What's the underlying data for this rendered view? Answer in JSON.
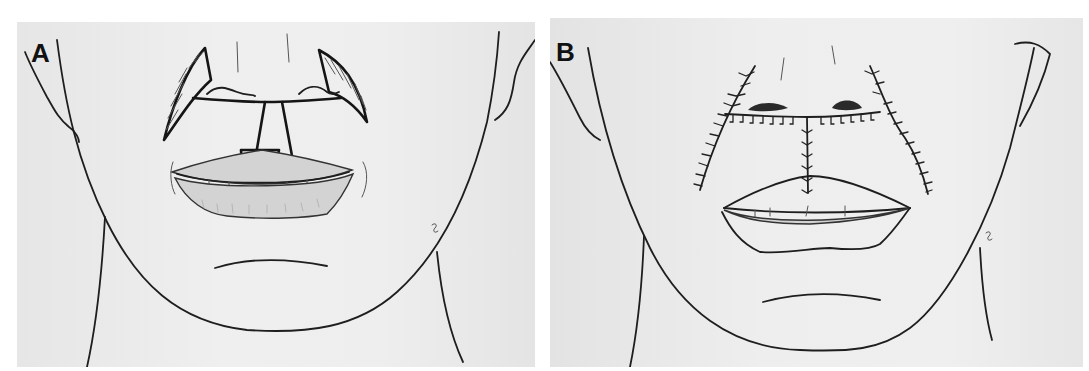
{
  "figure": {
    "panels": [
      {
        "id": "A",
        "label": "A",
        "description": "Preoperative drawing: upper lip lesion with planned central rectangular excision from nasal base to vermilion and bilateral crescentic perialar excisions (hatched)"
      },
      {
        "id": "B",
        "label": "B",
        "description": "Postoperative drawing: closure with inverted-T suture line along nasal sill and philtrum plus bilateral curved nasolabial suture lines"
      }
    ]
  },
  "colors": {
    "background": "#ffffff",
    "paper": "#ececec",
    "ink": "#1e1e1e",
    "lip_shade": "#d3d3d3"
  }
}
